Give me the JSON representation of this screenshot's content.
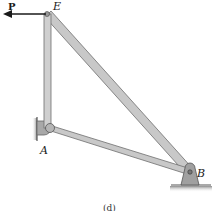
{
  "figure": {
    "caption": "(d)",
    "force": {
      "label": "P",
      "direction": "left",
      "color": "#1a1a1a"
    },
    "joints": [
      {
        "id": "E",
        "label": "E",
        "x": 47,
        "y": 14
      },
      {
        "id": "A",
        "label": "A",
        "x": 50,
        "y": 128
      },
      {
        "id": "B",
        "label": "B",
        "x": 190,
        "y": 172
      }
    ],
    "members": [
      {
        "from": "E",
        "to": "A"
      },
      {
        "from": "E",
        "to": "B"
      },
      {
        "from": "A",
        "to": "B"
      }
    ],
    "supports": [
      {
        "joint": "A",
        "type": "wall-pin"
      },
      {
        "joint": "B",
        "type": "ground-pin"
      }
    ],
    "colors": {
      "member_fill": "#c8c8c8",
      "member_edge": "#6e6e6e",
      "support_fill": "#9a9a9a",
      "ground": "#7a7a7a"
    }
  }
}
